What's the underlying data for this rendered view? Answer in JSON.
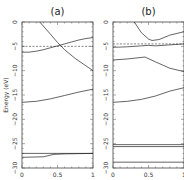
{
  "chart_data": [
    {
      "type": "line",
      "title": "(a)",
      "xlabel": "",
      "ylabel": "Energy (eV)",
      "xlim": [
        0,
        1
      ],
      "ylim": [
        -30,
        0
      ],
      "x_ticks": [
        "0",
        "0.5",
        "1"
      ],
      "y_ticks": [
        "0",
        "-5",
        "-10",
        "-15",
        "-20",
        "-25",
        "-30"
      ],
      "grid": false,
      "reference_line": {
        "style": "dashed",
        "y": -5.0
      },
      "series": [
        {
          "name": "band1",
          "x": [
            0.25,
            0.4,
            0.5,
            0.6,
            0.75,
            0.9,
            1.0
          ],
          "y": [
            0,
            -2.5,
            -4.2,
            -5.7,
            -7.5,
            -9.0,
            -10.0
          ]
        },
        {
          "name": "band2",
          "x": [
            0,
            0.1,
            0.2,
            0.3,
            0.4,
            0.5,
            0.6,
            0.7,
            0.8,
            0.9,
            1.0
          ],
          "y": [
            -6.2,
            -6.2,
            -6.0,
            -5.7,
            -5.3,
            -4.9,
            -4.5,
            -4.1,
            -3.7,
            -3.4,
            -3.2
          ]
        },
        {
          "name": "band3",
          "x": [
            0,
            0.2,
            0.4,
            0.6,
            0.8,
            1.0
          ],
          "y": [
            -16.5,
            -16.3,
            -15.8,
            -15.1,
            -14.4,
            -13.8
          ]
        },
        {
          "name": "band4",
          "x": [
            0,
            0.5,
            1.0
          ],
          "y": [
            -27.0,
            -27.0,
            -27.0
          ]
        },
        {
          "name": "band5",
          "x": [
            0,
            0.3,
            0.45,
            0.6,
            1.0
          ],
          "y": [
            -27.8,
            -27.7,
            -27.2,
            -27.1,
            -27.0
          ]
        }
      ]
    },
    {
      "type": "line",
      "title": "(b)",
      "xlabel": "",
      "ylabel": "",
      "xlim": [
        0,
        1
      ],
      "ylim": [
        -30,
        0
      ],
      "x_ticks": [
        "0",
        "0.5",
        "1"
      ],
      "y_ticks": [
        "0",
        "-5",
        "-10",
        "-15",
        "-20",
        "-25",
        "-30"
      ],
      "grid": false,
      "reference_line": {
        "style": "dashed",
        "y": -4.5
      },
      "series": [
        {
          "name": "band1",
          "x": [
            0.3,
            0.4,
            0.5,
            0.55,
            0.65,
            0.8,
            1.0
          ],
          "y": [
            0,
            -2.2,
            -3.5,
            -3.8,
            -3.6,
            -2.7,
            -2.0
          ]
        },
        {
          "name": "band2",
          "x": [
            0,
            0.2,
            0.4,
            0.5,
            0.6,
            0.8,
            1.0
          ],
          "y": [
            -5.2,
            -5.1,
            -4.9,
            -4.8,
            -4.9,
            -4.7,
            -4.5
          ]
        },
        {
          "name": "band3",
          "x": [
            0,
            0.2,
            0.45,
            0.6,
            0.8,
            1.0
          ],
          "y": [
            -7.8,
            -7.6,
            -7.2,
            -8.2,
            -9.5,
            -10.2
          ]
        },
        {
          "name": "band4",
          "x": [
            0,
            0.2,
            0.4,
            0.6,
            0.8,
            1.0
          ],
          "y": [
            -16.5,
            -16.3,
            -15.9,
            -15.2,
            -14.2,
            -13.5
          ]
        },
        {
          "name": "band5",
          "x": [
            0,
            1.0
          ],
          "y": [
            -25.2,
            -25.2
          ]
        },
        {
          "name": "band6",
          "x": [
            0,
            1.0
          ],
          "y": [
            -25.6,
            -25.6
          ]
        },
        {
          "name": "band7",
          "x": [
            0,
            1.0
          ],
          "y": [
            -28.8,
            -28.8
          ]
        }
      ]
    }
  ],
  "panels": [
    {
      "title": "(a)",
      "ylabel": "Energy (eV)"
    },
    {
      "title": "(b)",
      "ylabel": ""
    }
  ]
}
